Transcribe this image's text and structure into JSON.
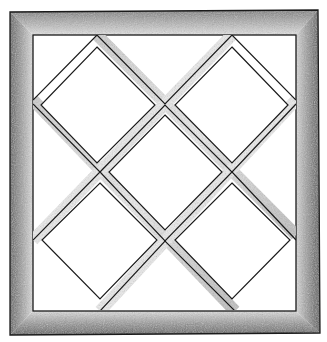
{
  "colors": {
    "background": "#ffffff",
    "ink": "#1a1a1a",
    "shade_dark": "#6e6e6e",
    "shade_light": "#d8d8d8"
  },
  "pieces": {
    "border": "outer-border",
    "inner_square": "inner-square",
    "diamond_count": 5
  }
}
